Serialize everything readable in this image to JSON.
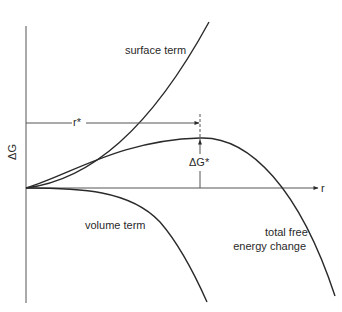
{
  "diagram": {
    "title": "",
    "axes": {
      "y_label": "ΔG",
      "x_label": "r"
    },
    "curves": [
      {
        "name": "surface term",
        "label": "surface term"
      },
      {
        "name": "volume term",
        "label": "volume term"
      },
      {
        "name": "total free energy change",
        "label_line1": "total free",
        "label_line2": "energy change"
      }
    ],
    "annotations": {
      "critical_radius": "r*",
      "barrier": "ΔG*"
    },
    "colors": {
      "line": "#2a2a2a",
      "background": "#ffffff"
    }
  }
}
